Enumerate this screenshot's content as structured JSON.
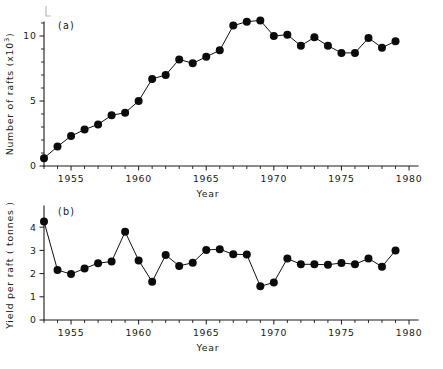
{
  "figure": {
    "background_color": "#ffffff",
    "ink_color": "#111111",
    "panels": [
      "a",
      "b"
    ]
  },
  "panel_a": {
    "label": "(a)",
    "ylabel": "Number of rafts  (x10",
    "ylabel_exponent": "3",
    "ylabel_close": ")",
    "xlabel": "Year",
    "ytick_labels": [
      "0",
      "5",
      "10"
    ],
    "xtick_labels": [
      "1955",
      "1960",
      "1965",
      "1970",
      "1975",
      "1980"
    ]
  },
  "panel_b": {
    "label": "(b)",
    "ylabel": "Yield per raft ( tonnes )",
    "xlabel": "Year",
    "ytick_labels": [
      "0",
      "1",
      "2",
      "3",
      "4"
    ],
    "xtick_labels": [
      "1955",
      "1960",
      "1965",
      "1970",
      "1975",
      "1980"
    ]
  },
  "chart_data": [
    {
      "type": "line",
      "panel": "a",
      "title": "(a)",
      "xlabel": "Year",
      "ylabel": "Number of rafts (x10^3)",
      "xlim": [
        1953,
        1980
      ],
      "ylim": [
        0,
        12
      ],
      "yticks": [
        0,
        5,
        10
      ],
      "xticks": [
        1955,
        1960,
        1965,
        1970,
        1975,
        1980
      ],
      "ytick_minor_step": 1,
      "xtick_minor_step": 1,
      "grid": false,
      "legend": false,
      "markers": "filled-circle",
      "x": [
        1953,
        1954,
        1955,
        1956,
        1957,
        1958,
        1959,
        1960,
        1961,
        1962,
        1963,
        1964,
        1965,
        1966,
        1967,
        1968,
        1969,
        1970,
        1971,
        1972,
        1973,
        1974,
        1975,
        1976,
        1977,
        1978,
        1979
      ],
      "values": [
        0.6,
        1.5,
        2.3,
        2.8,
        3.2,
        3.9,
        4.1,
        5.0,
        6.7,
        7.0,
        8.2,
        7.9,
        8.4,
        8.9,
        10.8,
        11.1,
        11.2,
        10.0,
        10.1,
        9.25,
        9.9,
        9.25,
        8.7,
        8.7,
        9.85,
        9.1,
        9.6
      ]
    },
    {
      "type": "line",
      "panel": "b",
      "title": "(b)",
      "xlabel": "Year",
      "ylabel": "Yield per raft (tonnes)",
      "xlim": [
        1953,
        1980
      ],
      "ylim": [
        0,
        4.6
      ],
      "yticks": [
        0,
        1,
        2,
        3,
        4
      ],
      "xticks": [
        1955,
        1960,
        1965,
        1970,
        1975,
        1980
      ],
      "ytick_minor_step": 1,
      "xtick_minor_step": 1,
      "grid": false,
      "legend": false,
      "markers": "filled-circle",
      "x": [
        1953,
        1954,
        1955,
        1956,
        1957,
        1958,
        1959,
        1960,
        1961,
        1962,
        1963,
        1964,
        1965,
        1966,
        1967,
        1968,
        1969,
        1970,
        1971,
        1972,
        1973,
        1974,
        1975,
        1976,
        1977,
        1978,
        1979
      ],
      "values": [
        4.25,
        2.15,
        1.98,
        2.22,
        2.45,
        2.52,
        3.8,
        2.57,
        1.65,
        2.8,
        2.33,
        2.47,
        3.02,
        3.05,
        2.83,
        2.82,
        1.45,
        1.62,
        2.65,
        2.4,
        2.4,
        2.38,
        2.46,
        2.4,
        2.65,
        2.3,
        3.0
      ]
    }
  ]
}
